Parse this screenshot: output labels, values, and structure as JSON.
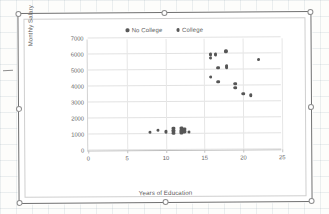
{
  "chart": {
    "legend": [
      {
        "label": "No College",
        "color": "#565656",
        "marker": "circle"
      },
      {
        "label": "College",
        "color": "#565656",
        "marker": "circle"
      }
    ],
    "yticks": [
      "0",
      "1000",
      "2000",
      "3000",
      "4000",
      "5000",
      "6000",
      "7000"
    ],
    "xticks": [
      "0",
      "5",
      "10",
      "15",
      "20",
      "25"
    ]
  },
  "chart_data": {
    "type": "scatter",
    "title": "",
    "xlabel": "Years of Education",
    "ylabel": "Monthly Salary",
    "xlim": [
      0,
      25
    ],
    "ylim": [
      0,
      7000
    ],
    "xtick_step": 5,
    "ytick_step": 1000,
    "grid": "horizontal-and-vertical",
    "legend_position": "top-center",
    "series": [
      {
        "name": "No College",
        "color": "#565656",
        "points": [
          [
            8,
            1100
          ],
          [
            9,
            1250
          ],
          [
            10,
            1150
          ],
          [
            11,
            1350
          ],
          [
            11,
            1200
          ],
          [
            11,
            1050
          ],
          [
            12,
            1350
          ],
          [
            12,
            1200
          ],
          [
            12,
            1080
          ],
          [
            12.4,
            1300
          ],
          [
            12.4,
            1150
          ],
          [
            13,
            1100
          ]
        ]
      },
      {
        "name": "College",
        "color": "#565656",
        "points": [
          [
            15.8,
            5950
          ],
          [
            15.8,
            5750
          ],
          [
            15.8,
            4550
          ],
          [
            16.5,
            5950
          ],
          [
            16.8,
            5100
          ],
          [
            16.8,
            4250
          ],
          [
            17.8,
            6150
          ],
          [
            17.9,
            5250
          ],
          [
            17.9,
            5150
          ],
          [
            19,
            4100
          ],
          [
            19,
            3850
          ],
          [
            20,
            3500
          ],
          [
            21,
            3400
          ],
          [
            22,
            5600
          ]
        ]
      }
    ]
  }
}
